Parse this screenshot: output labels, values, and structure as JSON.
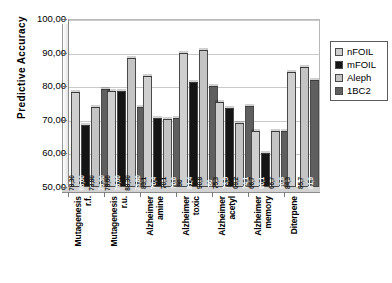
{
  "chart_data": {
    "type": "bar",
    "title": "",
    "xlabel": "",
    "ylabel": "Predictive  Accuracy",
    "ylim": [
      50,
      100
    ],
    "ytick_labels": [
      "100,00",
      "90,00",
      "80,00",
      "70,00",
      "60,00",
      "50,00"
    ],
    "ytick_values": [
      100,
      90,
      80,
      70,
      60,
      50
    ],
    "grid": true,
    "legend_position": "right",
    "categories": [
      "Mutagenesis r.f.",
      "Mutagenesis r.u.",
      "Alzheimer amine",
      "Alzheimer toxic",
      "Alzheimer acetyl",
      "Alzheimer memory",
      "Diterpene"
    ],
    "category_lines": [
      [
        "Mutagenesis",
        "r.f."
      ],
      [
        "Mutagenesis",
        "r.u."
      ],
      [
        "Alzheimer",
        "amine"
      ],
      [
        "Alzheimer",
        "toxic"
      ],
      [
        "Alzheimer",
        "acetyl"
      ],
      [
        "Alzheimer",
        "memory"
      ],
      [
        "Diterpene",
        ""
      ]
    ],
    "series": [
      {
        "name": "nFOIL",
        "color": "#cfcfcf",
        "values": [
          78.3,
          78.6,
          83.1,
          90,
          75.3,
          66.7,
          84.3
        ],
        "labels": [
          "78,30",
          "78,60",
          "83,1",
          "90",
          "75,3",
          "66,7",
          "84,3"
        ]
      },
      {
        "name": "mFOIL",
        "color": "#151515",
        "values": [
          68.6,
          78.6,
          70.4,
          81.4,
          73.5,
          60.1,
          null
        ],
        "labels": [
          "68,60",
          "78,60",
          "70,4",
          "81,4",
          "73,5",
          "60,1",
          ""
        ]
      },
      {
        "name": "Aleph",
        "color": "#c4c4c4",
        "values": [
          73.8,
          88.3,
          70.1,
          90.8,
          69.2,
          66.7,
          85.7
        ],
        "labels": [
          "73,80",
          "88,30",
          "70,1",
          "90,8",
          "69,2",
          "66,7",
          "85,7"
        ]
      },
      {
        "name": "1BC2",
        "color": "#5f5f5f",
        "values": [
          79.3,
          73.8,
          70.6,
          80,
          74.1,
          66.8,
          81.9
        ],
        "labels": [
          "79,30",
          "73,80",
          "70,6",
          "80",
          "74,1",
          "66,8",
          "81,9"
        ]
      }
    ]
  },
  "legend": {
    "items": [
      {
        "label": "nFOIL"
      },
      {
        "label": "mFOIL"
      },
      {
        "label": "Aleph"
      },
      {
        "label": "1BC2"
      }
    ]
  }
}
